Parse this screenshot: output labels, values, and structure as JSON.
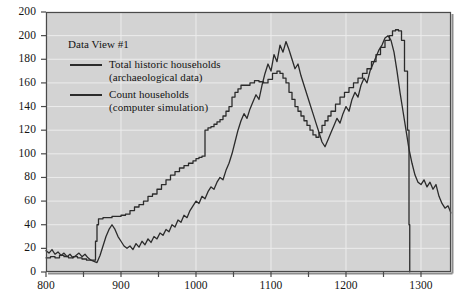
{
  "figure": {
    "name": "households-time-series",
    "background_color": "#ffffff",
    "plot_background_color": "#d3d3d3",
    "gridline_color": "#ececec",
    "axis_color": "#4a4a4a",
    "line_color": "#2b2b2b"
  },
  "legend": {
    "title": "Data View #1",
    "entries": [
      {
        "label_line1": "Total historic households",
        "label_line2": "(archaeological data)",
        "swatch_color": "#2b2b2b"
      },
      {
        "label_line1": "Count households",
        "label_line2": "(computer simulation)",
        "swatch_color": "#2b2b2b"
      }
    ]
  },
  "chart_data": {
    "type": "line",
    "title": "",
    "subtitle": "",
    "xlabel": "",
    "ylabel": "",
    "xlim": [
      800,
      1340
    ],
    "ylim": [
      0,
      220
    ],
    "grid": true,
    "legend_position": "top-left-inside",
    "x_tick_labels": [
      "800",
      "900",
      "1000",
      "1100",
      "1200",
      "1300"
    ],
    "x_tick_values": [
      800,
      900,
      1000,
      1100,
      1200,
      1300
    ],
    "x_minor_tick_values": [
      850,
      950,
      1050,
      1150,
      1250
    ],
    "y_tick_labels": [
      "0",
      "20",
      "40",
      "60",
      "80",
      "100",
      "120",
      "140",
      "160",
      "180",
      "200",
      "200"
    ],
    "y_tick_values": [
      0,
      20,
      40,
      60,
      80,
      100,
      120,
      140,
      160,
      180,
      200,
      220
    ],
    "series": [
      {
        "name": "Total historic households (archaeological data)",
        "style": "step",
        "color": "#2b2b2b",
        "x": [
          800,
          806,
          812,
          818,
          824,
          830,
          836,
          842,
          848,
          854,
          860,
          864,
          866,
          868,
          870,
          876,
          882,
          888,
          894,
          900,
          906,
          912,
          918,
          924,
          930,
          936,
          942,
          948,
          954,
          960,
          966,
          972,
          978,
          984,
          990,
          996,
          1000,
          1004,
          1008,
          1012,
          1016,
          1020,
          1024,
          1028,
          1032,
          1036,
          1040,
          1044,
          1048,
          1052,
          1056,
          1060,
          1066,
          1072,
          1078,
          1084,
          1090,
          1096,
          1102,
          1108,
          1112,
          1116,
          1120,
          1124,
          1128,
          1132,
          1136,
          1140,
          1144,
          1148,
          1152,
          1156,
          1160,
          1164,
          1168,
          1172,
          1176,
          1180,
          1186,
          1192,
          1198,
          1204,
          1210,
          1216,
          1222,
          1228,
          1234,
          1240,
          1246,
          1252,
          1258,
          1262,
          1266,
          1270,
          1274,
          1278,
          1282,
          1284,
          1285
        ],
        "y": [
          12,
          13,
          12,
          14,
          13,
          12,
          13,
          12,
          11,
          10,
          10,
          10,
          26,
          40,
          45,
          46,
          46,
          47,
          47,
          48,
          49,
          52,
          55,
          57,
          60,
          64,
          66,
          70,
          74,
          78,
          82,
          85,
          88,
          90,
          92,
          94,
          96,
          97,
          98,
          120,
          122,
          123,
          125,
          127,
          129,
          132,
          136,
          140,
          148,
          152,
          155,
          158,
          158,
          160,
          162,
          161,
          160,
          163,
          168,
          170,
          168,
          164,
          160,
          152,
          146,
          140,
          136,
          132,
          128,
          124,
          120,
          116,
          114,
          118,
          124,
          128,
          132,
          136,
          142,
          148,
          152,
          156,
          160,
          164,
          168,
          172,
          178,
          184,
          190,
          196,
          200,
          204,
          205,
          204,
          196,
          170,
          120,
          40,
          0
        ]
      },
      {
        "name": "Count households (computer simulation)",
        "style": "noisy",
        "color": "#2b2b2b",
        "x": [
          800,
          804,
          808,
          812,
          816,
          820,
          824,
          828,
          832,
          836,
          840,
          844,
          848,
          852,
          856,
          860,
          864,
          868,
          872,
          876,
          880,
          884,
          888,
          892,
          896,
          900,
          904,
          908,
          912,
          916,
          920,
          924,
          928,
          932,
          936,
          940,
          944,
          948,
          952,
          956,
          960,
          964,
          968,
          972,
          976,
          980,
          984,
          988,
          992,
          996,
          1000,
          1004,
          1008,
          1012,
          1016,
          1020,
          1024,
          1028,
          1032,
          1036,
          1040,
          1044,
          1048,
          1052,
          1056,
          1060,
          1064,
          1068,
          1072,
          1076,
          1080,
          1084,
          1088,
          1092,
          1096,
          1100,
          1104,
          1108,
          1112,
          1116,
          1120,
          1124,
          1128,
          1132,
          1136,
          1140,
          1144,
          1148,
          1152,
          1156,
          1160,
          1164,
          1168,
          1172,
          1176,
          1180,
          1184,
          1188,
          1192,
          1196,
          1200,
          1204,
          1208,
          1212,
          1216,
          1220,
          1224,
          1228,
          1232,
          1236,
          1240,
          1244,
          1248,
          1252,
          1256,
          1260,
          1264,
          1268,
          1272,
          1276,
          1280,
          1284,
          1288,
          1292,
          1296,
          1300,
          1304,
          1308,
          1312,
          1316,
          1320,
          1324,
          1328,
          1332,
          1336,
          1340
        ],
        "y": [
          18,
          16,
          19,
          15,
          17,
          14,
          16,
          13,
          15,
          12,
          14,
          16,
          13,
          15,
          12,
          10,
          9,
          8,
          14,
          22,
          30,
          36,
          40,
          36,
          30,
          26,
          22,
          20,
          22,
          19,
          24,
          21,
          26,
          23,
          28,
          25,
          30,
          28,
          33,
          31,
          36,
          34,
          40,
          38,
          44,
          42,
          48,
          46,
          52,
          56,
          60,
          58,
          64,
          62,
          68,
          72,
          70,
          76,
          80,
          78,
          86,
          92,
          100,
          110,
          120,
          128,
          134,
          130,
          138,
          144,
          150,
          146,
          158,
          168,
          176,
          170,
          184,
          178,
          192,
          186,
          195,
          188,
          180,
          172,
          176,
          166,
          158,
          150,
          142,
          134,
          126,
          118,
          110,
          106,
          112,
          118,
          124,
          130,
          126,
          134,
          140,
          136,
          146,
          152,
          148,
          158,
          164,
          160,
          170,
          176,
          182,
          188,
          192,
          198,
          200,
          196,
          186,
          170,
          152,
          136,
          120,
          104,
          92,
          82,
          76,
          74,
          78,
          72,
          76,
          70,
          74,
          64,
          58,
          54,
          56,
          50
        ]
      }
    ]
  }
}
